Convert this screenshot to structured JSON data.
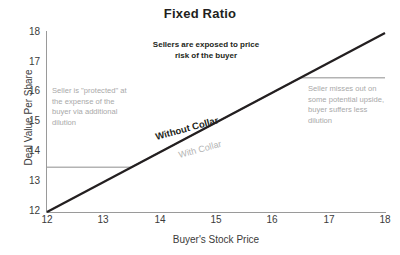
{
  "chart_data": {
    "type": "line",
    "title": "Fixed Ratio",
    "xlabel": "Buyer's Stock Price",
    "ylabel": "Deal Value Per Share",
    "xlim": [
      12,
      18
    ],
    "ylim": [
      12,
      18
    ],
    "xticks": [
      "12",
      "13",
      "14",
      "15",
      "16",
      "17",
      "18"
    ],
    "yticks": [
      "18",
      "17",
      "16",
      "15",
      "14",
      "13",
      "12"
    ],
    "grid": false,
    "legend_position": "inline",
    "series": [
      {
        "name": "Without Collar",
        "color": "#231f20",
        "style": "solid-bold",
        "points": [
          [
            12,
            12
          ],
          [
            18,
            18
          ]
        ]
      },
      {
        "name": "With Collar",
        "color": "#b3b3b3",
        "style": "solid",
        "points": [
          [
            12,
            13.5
          ],
          [
            13.5,
            13.5
          ],
          [
            16.5,
            16.5
          ],
          [
            18,
            16.5
          ]
        ]
      }
    ],
    "annotations": [
      {
        "id": "note-center",
        "text": "Sellers are exposed to price risk of the buyer",
        "emphasis": "bold",
        "color": "#231f20"
      },
      {
        "id": "note-left",
        "text": "Seller is \"protected\" at the expense of the buyer via additional dilution",
        "emphasis": "normal",
        "color": "#a9a9a9"
      },
      {
        "id": "note-right",
        "text": "Seller misses out on some potential upside, buyer suffers less dilution",
        "emphasis": "normal",
        "color": "#a9a9a9"
      }
    ]
  },
  "labels": {
    "without_collar": "Without Collar",
    "with_collar": "With Collar",
    "note_center": "Sellers are exposed to price risk of the buyer",
    "note_left": "Seller is \"protected\" at the expense of the buyer via additional dilution",
    "note_right": "Seller misses out on some potential upside, buyer suffers less dilution"
  },
  "colors": {
    "line_primary": "#231f20",
    "line_secondary": "#b3b3b3",
    "axis": "#9a9a9a",
    "text_muted": "#a9a9a9",
    "background": "#ffffff"
  }
}
